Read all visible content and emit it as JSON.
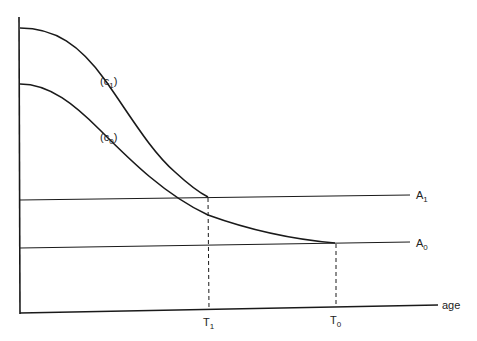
{
  "diagram": {
    "axes": {
      "x_label": "age",
      "y_label": ""
    },
    "curves": [
      {
        "id": "c1",
        "label": "(c",
        "subscript": "1",
        "close": ")"
      },
      {
        "id": "c0",
        "label": "(c",
        "subscript": "0",
        "close": ")"
      }
    ],
    "levels": [
      {
        "id": "A1",
        "label": "A",
        "subscript": "1"
      },
      {
        "id": "A0",
        "label": "A",
        "subscript": "0"
      }
    ],
    "ticks": [
      {
        "id": "T1",
        "label": "T",
        "subscript": "1"
      },
      {
        "id": "T0",
        "label": "T",
        "subscript": "0"
      }
    ],
    "colors": {
      "line": "#1a1a1a",
      "background": "#ffffff"
    }
  }
}
